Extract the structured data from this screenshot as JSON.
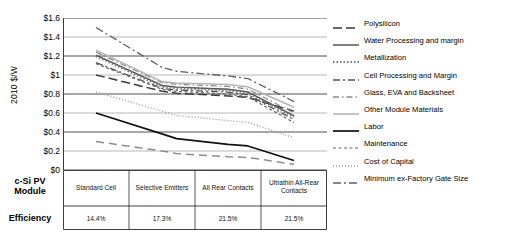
{
  "axis": {
    "y_title": "2010 $/W",
    "y_ticks": [
      "$1.6",
      "$1.4",
      "$1.2",
      "$1",
      "$0.8",
      "$0.6",
      "$0.4",
      "$0.2",
      "$0"
    ]
  },
  "table": {
    "row_headers": [
      "c-Si PV Module",
      "Efficiency"
    ],
    "module_header_line1": "c-Si PV",
    "module_header_line2": "Module",
    "efficiency_header": "Efficiency",
    "columns": [
      {
        "module": "Standard Cell",
        "efficiency": "14.4%"
      },
      {
        "module": "Selective Emitters",
        "efficiency": "17.3%"
      },
      {
        "module": "All Rear Contacts",
        "efficiency": "21.5%"
      },
      {
        "module": "Ultrathin All-Rear Contacts",
        "efficiency": "21.5%"
      }
    ]
  },
  "legend": {
    "items": [
      {
        "label": "Polysilicon"
      },
      {
        "label": "Water Processing and margin"
      },
      {
        "label": "Metallization"
      },
      {
        "label": "Cell Processing and Margin"
      },
      {
        "label": "Glass, EVA and Backsheet"
      },
      {
        "label": "Other Module Materials"
      },
      {
        "label": "Labor"
      },
      {
        "label": "Maintenance"
      },
      {
        "label": "Cost of Capital"
      },
      {
        "label": "Minimum ex-Factory Gate Size"
      }
    ]
  },
  "chart_data": {
    "type": "line",
    "title": "",
    "xlabel": "",
    "ylabel": "2010 $/W",
    "ylim": [
      0,
      1.6
    ],
    "yticks": [
      0,
      0.2,
      0.4,
      0.6,
      0.8,
      1.0,
      1.2,
      1.4,
      1.6
    ],
    "grid": true,
    "legend_position": "right",
    "categories": [
      "Standard Cell",
      "Selective Emitters",
      "All Rear Contacts",
      "Ultrathin All-Rear Contacts"
    ],
    "series": [
      {
        "name": "Polysilicon",
        "values": [
          1.0,
          0.83,
          0.78,
          0.62
        ],
        "color": "#3a3a3a",
        "dash": "9,4",
        "width": 1.5
      },
      {
        "name": "Water Processing and margin",
        "values": [
          1.21,
          0.89,
          0.85,
          0.57
        ],
        "color": "#4a4a4a",
        "dash": "none",
        "width": 1.4
      },
      {
        "name": "Metallization",
        "values": [
          1.2,
          0.88,
          0.84,
          0.56
        ],
        "color": "#777777",
        "dash": "1.5,2",
        "width": 2.6
      },
      {
        "name": "Cell Processing and Margin",
        "values": [
          1.13,
          0.86,
          0.82,
          0.53
        ],
        "color": "#555555",
        "dash": "7,3,2,3",
        "width": 1.3
      },
      {
        "name": "Glass, EVA and Backsheet",
        "values": [
          1.24,
          0.92,
          0.88,
          0.6
        ],
        "color": "#8a8a8a",
        "dash": "6,3,1.5,3",
        "width": 1.3
      },
      {
        "name": "Other Module Materials",
        "values": [
          1.26,
          0.93,
          0.9,
          0.66
        ],
        "color": "#b5b5b5",
        "dash": "none",
        "width": 1.6
      },
      {
        "name": "Labor",
        "values": [
          0.6,
          0.38,
          0.27,
          0.1
        ],
        "color": "#111111",
        "dash": "none",
        "width": 1.7
      },
      {
        "name": "Maintenance",
        "values": [
          1.12,
          0.85,
          0.8,
          0.5
        ],
        "color": "#666666",
        "dash": "3,2.5",
        "width": 1.2
      },
      {
        "name": "Cost of Capital",
        "values": [
          0.82,
          0.62,
          0.52,
          0.34
        ],
        "color": "#9d9d9d",
        "dash": "1,2",
        "width": 1.4
      },
      {
        "name": "Minimum ex-Factory Gate Size",
        "values": [
          1.5,
          1.08,
          0.99,
          0.72
        ],
        "color": "#606060",
        "dash": "8,3,2,3",
        "width": 1.3
      },
      {
        "name": "Lower band",
        "values": [
          0.3,
          0.2,
          0.14,
          0.06
        ],
        "color": "#8d8d8d",
        "dash": "8,5",
        "width": 1.5
      }
    ]
  }
}
